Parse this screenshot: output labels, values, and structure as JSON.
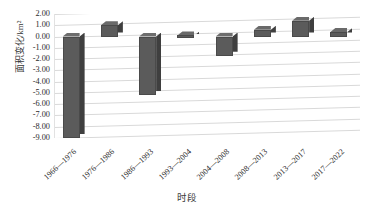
{
  "chart_data": {
    "type": "bar",
    "title": "",
    "xlabel": "时段",
    "ylabel": "面积变化/km²",
    "categories": [
      "1966—1976",
      "1976—1986",
      "1986—1993",
      "1993—2004",
      "2004—2008",
      "2008—2013",
      "2013—2017",
      "2017—2022"
    ],
    "values": [
      -9.0,
      1.0,
      -5.2,
      0.1,
      -1.7,
      0.6,
      1.4,
      0.4
    ],
    "series": [
      {
        "name": "面积变化",
        "values": [
          -9.0,
          1.0,
          -5.2,
          0.1,
          -1.7,
          0.6,
          1.4,
          0.4
        ]
      }
    ],
    "ylim": [
      -9.0,
      2.0
    ],
    "ytick_labels": [
      "2.00",
      "1.00",
      "0.00",
      "-1.00",
      "-2.00",
      "-3.00",
      "-4.00",
      "-5.00",
      "-6.00",
      "-7.00",
      "-8.00",
      "-9.00"
    ],
    "ytick_values": [
      2,
      1,
      0,
      -1,
      -2,
      -3,
      -4,
      -5,
      -6,
      -7,
      -8,
      -9
    ],
    "grid": true,
    "legend": "none",
    "bar_color": "#5b5b5b",
    "grid_color": "#d9d9d9",
    "style": "3d-column"
  }
}
